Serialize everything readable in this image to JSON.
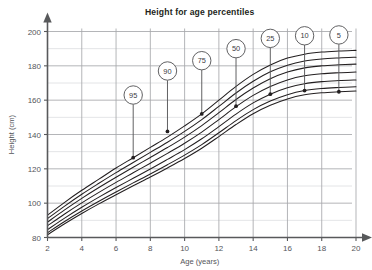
{
  "chart_data": {
    "type": "line",
    "title": "Height for age percentiles",
    "xlabel": "Age (years)",
    "ylabel": "Height (cm)",
    "xlim": [
      2,
      20
    ],
    "ylim": [
      80,
      200
    ],
    "grid": true,
    "legend": "callout-bubbles-on-curves",
    "x_ticks": [
      2,
      4,
      6,
      8,
      10,
      12,
      14,
      16,
      18,
      20
    ],
    "y_ticks": [
      80,
      100,
      120,
      140,
      160,
      180,
      200
    ],
    "y_minor_ticks": [
      90,
      110,
      130,
      150,
      170,
      190
    ],
    "x": [
      2,
      3,
      4,
      5,
      6,
      7,
      8,
      9,
      10,
      11,
      12,
      13,
      14,
      15,
      16,
      17,
      18,
      19,
      20
    ],
    "series": [
      {
        "name": "95",
        "label": "95",
        "values": [
          93.0,
          100.5,
          107.5,
          114.0,
          120.5,
          126.5,
          132.5,
          138.5,
          145.0,
          152.0,
          160.0,
          168.0,
          175.0,
          180.5,
          184.5,
          186.8,
          188.0,
          188.6,
          189.0
        ],
        "callout": {
          "x": 7,
          "y": 126.5,
          "bubble_x": 7,
          "bubble_y": 163.0
        }
      },
      {
        "name": "90",
        "label": "90",
        "values": [
          91.0,
          98.3,
          105.2,
          111.6,
          117.8,
          123.7,
          129.6,
          135.5,
          141.8,
          148.7,
          156.4,
          164.2,
          171.0,
          176.5,
          180.4,
          182.8,
          184.0,
          184.6,
          185.0
        ],
        "callout": {
          "x": 9,
          "y": 141.8,
          "bubble_x": 9,
          "bubble_y": 177.0
        }
      },
      {
        "name": "75",
        "label": "75",
        "values": [
          89.0,
          96.1,
          102.8,
          109.1,
          115.1,
          120.9,
          126.6,
          132.4,
          138.5,
          145.2,
          152.7,
          160.4,
          167.1,
          172.5,
          176.4,
          178.8,
          180.0,
          180.6,
          181.0
        ],
        "callout": {
          "x": 11,
          "y": 152.0,
          "bubble_x": 11,
          "bubble_y": 183.0
        }
      },
      {
        "name": "50",
        "label": "50",
        "values": [
          86.8,
          93.7,
          100.2,
          106.3,
          112.1,
          117.7,
          123.3,
          129.0,
          134.9,
          141.4,
          148.7,
          156.2,
          162.8,
          168.0,
          171.8,
          174.2,
          175.4,
          176.0,
          176.4
        ],
        "callout": {
          "x": 13,
          "y": 156.5,
          "bubble_x": 13,
          "bubble_y": 190.0
        }
      },
      {
        "name": "25",
        "label": "25",
        "values": [
          84.6,
          91.3,
          97.6,
          103.5,
          109.1,
          114.5,
          119.9,
          125.5,
          131.2,
          137.5,
          144.6,
          151.9,
          158.4,
          163.5,
          167.2,
          169.6,
          170.8,
          171.4,
          171.8
        ],
        "callout": {
          "x": 15,
          "y": 163.5,
          "bubble_x": 15,
          "bubble_y": 196.0
        }
      },
      {
        "name": "10",
        "label": "10",
        "values": [
          82.8,
          89.3,
          95.4,
          101.1,
          106.5,
          111.8,
          117.0,
          122.4,
          128.0,
          134.1,
          141.0,
          148.1,
          154.5,
          159.5,
          163.2,
          165.6,
          166.8,
          167.4,
          167.8
        ],
        "callout": {
          "x": 17,
          "y": 165.6,
          "bubble_x": 17,
          "bubble_y": 197.5
        }
      },
      {
        "name": "5",
        "label": "5",
        "values": [
          81.6,
          88.0,
          94.0,
          99.6,
          104.9,
          110.1,
          115.2,
          120.5,
          126.0,
          132.0,
          138.8,
          145.8,
          152.1,
          157.0,
          160.7,
          163.1,
          164.3,
          164.9,
          165.3
        ],
        "callout": {
          "x": 19,
          "y": 164.9,
          "bubble_x": 19,
          "bubble_y": 198.0
        }
      }
    ],
    "colors": {
      "curve": "#231f20",
      "grid_major": "#a6a8ab",
      "grid_minor": "#dcdddf",
      "axis": "#58595b",
      "callout_stroke": "#58595b",
      "callout_fill": "#ffffff",
      "marker": "#231f20",
      "text": "#54555a",
      "title": "#231f20"
    }
  }
}
